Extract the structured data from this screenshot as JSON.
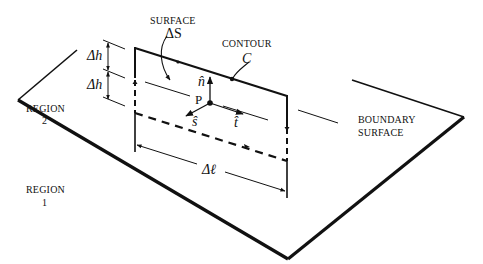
{
  "labels": {
    "surface_title": "SURFACE",
    "surface_symbol": "ΔS",
    "contour_title": "CONTOUR",
    "contour_symbol": "C",
    "delta_h_upper": "Δh",
    "delta_h_lower": "Δh",
    "point": "P",
    "n_hat": "n̂",
    "s_hat": "ŝ",
    "t_hat": "t̂",
    "delta_l": "Δℓ",
    "region2_line1": "REGION",
    "region2_line2": "2",
    "region1_line1": "REGION",
    "region1_line2": "1",
    "boundary_line1": "BOUNDARY",
    "boundary_line2": "SURFACE"
  },
  "colors": {
    "ink": "#111111",
    "background": "#ffffff"
  }
}
